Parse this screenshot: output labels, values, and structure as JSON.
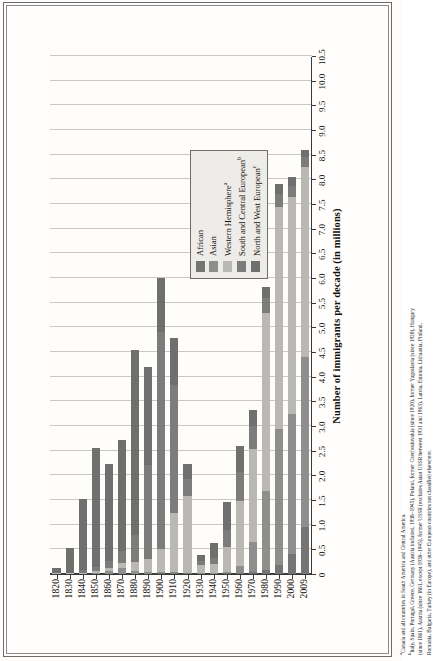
{
  "chart_data": {
    "type": "bar",
    "orientation": "horizontal-stacked",
    "title": "",
    "xlabel": "",
    "ylabel": "Number of immigrants per decade (in millions)",
    "value_axis_label": "Number of immigrants per decade (in millions)",
    "ylim": [
      0,
      10.5
    ],
    "value_ticks": [
      "0",
      "0.5",
      "1.0",
      "1.5",
      "2.0",
      "2.5",
      "3.0",
      "3.5",
      "4.0",
      "4.5",
      "5.0",
      "5.5",
      "6.0",
      "6.5",
      "7.0",
      "7.5",
      "8.0",
      "8.5",
      "9.0",
      "9.5",
      "10.0",
      "10.5"
    ],
    "grid": true,
    "legend_position": "inside-lower-left",
    "categories": [
      "1820",
      "1830",
      "1840",
      "1850",
      "1860",
      "1870",
      "1880",
      "1890",
      "1900",
      "1910",
      "1920",
      "1930",
      "1940",
      "1950",
      "1960",
      "1970",
      "1980",
      "1990",
      "2000",
      "2009"
    ],
    "series": [
      {
        "name": "North and West European",
        "color": "#6f6f6f",
        "values": [
          0.1,
          0.5,
          1.45,
          2.4,
          1.95,
          2.25,
          3.75,
          2.0,
          1.1,
          0.95,
          0.3,
          0.12,
          0.3,
          0.55,
          0.52,
          0.33,
          0.22,
          0.2,
          0.18,
          0.15
        ]
      },
      {
        "name": "South and Central European",
        "color": "#7c7c7c",
        "values": [
          0.01,
          0.02,
          0.05,
          0.08,
          0.14,
          0.25,
          0.55,
          1.9,
          4.4,
          2.6,
          0.35,
          0.08,
          0.12,
          0.35,
          0.6,
          0.45,
          0.3,
          0.27,
          0.22,
          0.2
        ]
      },
      {
        "name": "Western Hemisphere",
        "color": "#b9b8b4",
        "values": [
          0.01,
          0.01,
          0.03,
          0.05,
          0.07,
          0.1,
          0.18,
          0.25,
          0.45,
          1.2,
          1.55,
          0.18,
          0.18,
          0.5,
          1.3,
          1.9,
          3.6,
          4.5,
          4.4,
          3.85
        ]
      },
      {
        "name": "Asian",
        "color": "#8e8e8e",
        "values": [
          0.0,
          0.0,
          0.0,
          0.02,
          0.06,
          0.12,
          0.07,
          0.05,
          0.04,
          0.03,
          0.02,
          0.01,
          0.02,
          0.04,
          0.15,
          0.6,
          1.6,
          2.75,
          2.85,
          3.45
        ]
      },
      {
        "name": "African",
        "color": "#757575",
        "values": [
          0.0,
          0.0,
          0.0,
          0.0,
          0.0,
          0.0,
          0.0,
          0.0,
          0.01,
          0.01,
          0.01,
          0.0,
          0.0,
          0.01,
          0.02,
          0.04,
          0.09,
          0.18,
          0.4,
          0.95
        ]
      }
    ],
    "totals": [
      0.12,
      0.53,
      1.53,
      2.55,
      2.22,
      2.72,
      4.55,
      4.2,
      6.0,
      4.79,
      2.23,
      0.39,
      0.62,
      1.45,
      2.59,
      3.32,
      5.81,
      7.9,
      8.05,
      8.6
    ]
  },
  "legend": {
    "items": [
      {
        "label": "African",
        "sup": "",
        "color": "#757575",
        "name": "african"
      },
      {
        "label": "Asian",
        "sup": "",
        "color": "#8e8e8e",
        "name": "asian"
      },
      {
        "label": "Western Hemisphere",
        "sup": "a",
        "color": "#b9b8b4",
        "name": "western-hemisphere"
      },
      {
        "label": "South and Central European",
        "sup": "b",
        "color": "#7c7c7c",
        "name": "south-and-central-european"
      },
      {
        "label": "North and West European",
        "sup": "c",
        "color": "#6f6f6f",
        "name": "north-and-west-european"
      }
    ]
  },
  "axis": {
    "value_title": "Number of immigrants per decade (in millions)",
    "value_ticks": [
      "10.5",
      "10.0",
      "9.5",
      "9.0",
      "8.5",
      "8.0",
      "7.5",
      "7.0",
      "6.5",
      "6.0",
      "5.5",
      "5.0",
      "4.5",
      "4.0",
      "3.5",
      "3.0",
      "2.5",
      "2.0",
      "1.5",
      "1.0",
      "0.5",
      "0"
    ],
    "category_ticks": [
      "1820",
      "1830",
      "1840",
      "1850",
      "1860",
      "1870",
      "1880",
      "1890",
      "1900",
      "1910",
      "1920",
      "1930",
      "1940",
      "1950",
      "1960",
      "1970",
      "1980",
      "1990",
      "2000",
      "2009"
    ]
  },
  "footnotes": {
    "a": "Canada and all countries in South America and Central America.",
    "b": "Italy, Spain, Portugal, Greece, Germany (Austria included, 1938–1945), Poland, former Czechoslovakia (since 1920), former Yugoslavia (since 1920), Hungary (since 1861), Austria (since 1861, except 1938–1945), former USSR (excludes Asian USSR between 1931 and 1963), Latvia, Estonia, Lithuania, Finland, Romania, Bulgaria, Turkey (in Europe), and other European countries not classified elsewhere.",
    "a_marker": "a",
    "b_marker": "b"
  }
}
